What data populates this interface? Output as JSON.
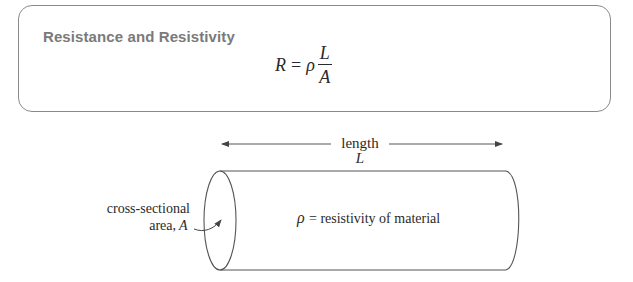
{
  "box": {
    "title": "Resistance and Resistivity",
    "formula": {
      "lhs": "R",
      "equals": "=",
      "rho": "ρ",
      "numerator": "L",
      "denominator": "A"
    }
  },
  "diagram": {
    "length_label": "length",
    "length_symbol": "L",
    "area_label_line1": "cross-sectional",
    "area_label_line2": "area,",
    "area_symbol": "A",
    "rho_symbol": "ρ",
    "rho_label": "= resistivity of material",
    "colors": {
      "stroke": "#555555",
      "text": "#2a2a2a",
      "box_border": "#8a8a8a",
      "title": "#7a7a7a"
    }
  }
}
